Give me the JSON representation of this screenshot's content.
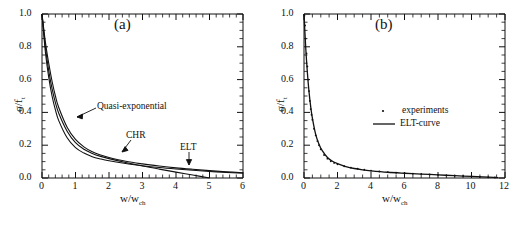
{
  "figure": {
    "background": "#ffffff",
    "ink_color": "#111111",
    "panels": [
      "a",
      "b"
    ]
  },
  "panel_a": {
    "label": "(a)",
    "axis": {
      "xlabel_main": "w/w",
      "xlabel_sub": "ch",
      "ylabel_main": "σ/f",
      "ylabel_sub": "t",
      "xticks": [
        "0",
        "1",
        "2",
        "3",
        "4",
        "5",
        "6"
      ],
      "yticks": [
        "0.0",
        "0.2",
        "0.4",
        "0.6",
        "0.8",
        "1.0"
      ]
    },
    "annotations": [
      {
        "text": "Quasi-exponential",
        "target": "quasi-exponential-curve"
      },
      {
        "text": "CHR",
        "target": "chr-curve"
      },
      {
        "text": "ELT",
        "target": "elt-curve"
      }
    ]
  },
  "panel_b": {
    "label": "(b)",
    "axis": {
      "xlabel_main": "w/w",
      "xlabel_sub": "ch",
      "ylabel_main": "σ/f",
      "ylabel_sub": "t",
      "xticks": [
        "0",
        "2",
        "4",
        "6",
        "8",
        "10",
        "12"
      ],
      "yticks": [
        "0.0",
        "0.2",
        "0.4",
        "0.6",
        "0.8",
        "1.0"
      ]
    },
    "legend": [
      {
        "label": "experiments",
        "marker": "dot"
      },
      {
        "label": "ELT-curve",
        "marker": "line"
      }
    ]
  },
  "chart_data": [
    {
      "type": "line",
      "title": "(a)",
      "xlabel": "w/w_ch",
      "ylabel": "sigma/f_t",
      "xlim": [
        0,
        6
      ],
      "ylim": [
        0,
        1.0
      ],
      "xticks": [
        0,
        1,
        2,
        3,
        4,
        5,
        6
      ],
      "yticks": [
        0.0,
        0.2,
        0.4,
        0.6,
        0.8,
        1.0
      ],
      "grid": false,
      "legend": "none",
      "annotations": [
        "Quasi-exponential",
        "CHR",
        "ELT"
      ],
      "series": [
        {
          "name": "Quasi-exponential",
          "x": [
            0,
            0.1,
            0.2,
            0.3,
            0.4,
            0.5,
            0.75,
            1.0,
            1.25,
            1.5,
            1.75,
            2.0,
            2.5,
            3.0,
            3.5,
            4.0,
            4.5,
            5.0,
            5.5,
            6.0
          ],
          "y": [
            1.0,
            0.83,
            0.7,
            0.59,
            0.5,
            0.43,
            0.31,
            0.235,
            0.19,
            0.16,
            0.14,
            0.125,
            0.102,
            0.086,
            0.073,
            0.062,
            0.053,
            0.045,
            0.038,
            0.032
          ]
        },
        {
          "name": "CHR",
          "x": [
            0,
            0.1,
            0.2,
            0.3,
            0.4,
            0.5,
            0.75,
            1.0,
            1.25,
            1.5,
            1.75,
            2.0,
            2.5,
            3.0,
            3.5,
            4.0,
            4.5,
            5.0
          ],
          "y": [
            1.0,
            0.8,
            0.655,
            0.545,
            0.46,
            0.395,
            0.285,
            0.215,
            0.175,
            0.15,
            0.132,
            0.118,
            0.094,
            0.073,
            0.054,
            0.036,
            0.018,
            0.0
          ]
        },
        {
          "name": "ELT",
          "x": [
            0,
            0.1,
            0.2,
            0.3,
            0.4,
            0.5,
            0.75,
            1.0,
            1.25,
            1.5,
            1.75,
            2.0,
            2.5,
            3.0,
            3.5,
            4.0,
            4.5,
            5.0,
            5.5,
            6.0
          ],
          "y": [
            1.0,
            0.77,
            0.615,
            0.5,
            0.415,
            0.35,
            0.245,
            0.185,
            0.152,
            0.13,
            0.116,
            0.105,
            0.088,
            0.075,
            0.064,
            0.055,
            0.047,
            0.04,
            0.034,
            0.029
          ]
        }
      ]
    },
    {
      "type": "line",
      "title": "(b)",
      "xlabel": "w/w_ch",
      "ylabel": "sigma/f_t",
      "xlim": [
        0,
        12
      ],
      "ylim": [
        0,
        1.0
      ],
      "xticks": [
        0,
        2,
        4,
        6,
        8,
        10,
        12
      ],
      "yticks": [
        0.0,
        0.2,
        0.4,
        0.6,
        0.8,
        1.0
      ],
      "grid": false,
      "legend": "upper-right",
      "series": [
        {
          "name": "ELT-curve",
          "style": "solid-line",
          "x": [
            0,
            0.1,
            0.2,
            0.3,
            0.4,
            0.5,
            0.7,
            0.9,
            1.1,
            1.4,
            1.7,
            2.0,
            2.5,
            3.0,
            3.5,
            4.0,
            5.0,
            6.0,
            7.0,
            8.0,
            9.0,
            10.0,
            11.0,
            11.6
          ],
          "y": [
            1.0,
            0.8,
            0.645,
            0.525,
            0.435,
            0.365,
            0.265,
            0.205,
            0.165,
            0.125,
            0.102,
            0.088,
            0.07,
            0.058,
            0.05,
            0.044,
            0.035,
            0.029,
            0.024,
            0.019,
            0.014,
            0.01,
            0.005,
            0.002
          ]
        },
        {
          "name": "experiments",
          "style": "dots",
          "x": [
            0.02,
            0.06,
            0.1,
            0.15,
            0.2,
            0.25,
            0.3,
            0.35,
            0.4,
            0.45,
            0.5,
            0.6,
            0.7,
            0.8,
            0.9,
            1.0,
            1.2,
            1.4,
            1.6,
            1.8,
            2.0,
            2.4,
            2.8,
            3.2,
            3.6,
            4.0,
            4.5,
            5.0,
            5.5,
            6.0,
            6.5,
            7.0,
            7.5,
            8.0,
            8.5,
            9.0,
            9.5,
            10.0,
            10.5,
            11.0,
            11.4
          ],
          "y": [
            0.99,
            0.93,
            0.85,
            0.76,
            0.68,
            0.6,
            0.53,
            0.47,
            0.42,
            0.385,
            0.355,
            0.3,
            0.26,
            0.225,
            0.2,
            0.175,
            0.14,
            0.118,
            0.102,
            0.092,
            0.084,
            0.072,
            0.063,
            0.056,
            0.05,
            0.045,
            0.04,
            0.036,
            0.032,
            0.029,
            0.026,
            0.024,
            0.021,
            0.019,
            0.016,
            0.014,
            0.012,
            0.01,
            0.007,
            0.005,
            0.003
          ]
        }
      ]
    }
  ]
}
